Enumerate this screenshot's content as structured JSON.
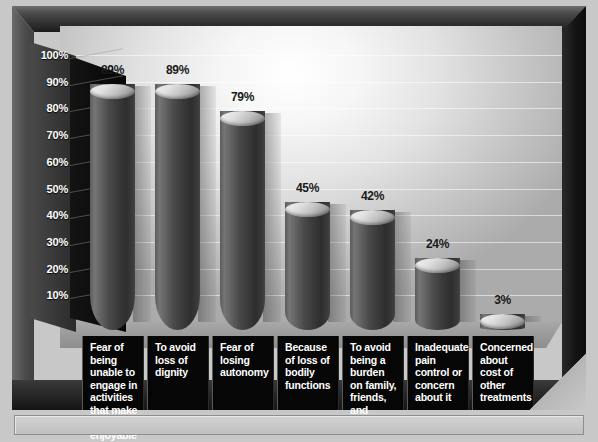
{
  "chart_data": {
    "type": "bar",
    "title": "",
    "subtitle": "",
    "xlabel": "",
    "ylabel": "",
    "ylim": [
      0,
      100
    ],
    "grid": true,
    "legend": "none",
    "categories": [
      "Fear of being unable to engage in activities that make life enjoyable",
      "To avoid loss of dignity",
      "Fear of losing autonomy",
      "Because of loss of bodily functions",
      "To avoid being a burden on family, friends, and caregivers",
      "Inadequate pain control or concern about it",
      "Concerned about cost of other treatments"
    ],
    "values": [
      89,
      89,
      79,
      45,
      42,
      24,
      3
    ],
    "value_labels": [
      "89%",
      "89%",
      "79%",
      "45%",
      "42%",
      "24%",
      "3%"
    ],
    "ytick_labels": [
      "100%",
      "90%",
      "80%",
      "70%",
      "60%",
      "50%",
      "40%",
      "30%",
      "20%",
      "10%"
    ],
    "ytick_values": [
      100,
      90,
      80,
      70,
      60,
      50,
      40,
      30,
      20,
      10
    ]
  },
  "chart": {
    "bar_color": "#3a3a3a",
    "bar_highlight_color": "#757575",
    "bar_top_color": "#e2e2e2",
    "background_color": "#ffffff",
    "frame_color": "#1c1c1c",
    "label_box_color": "#060606",
    "label_text_color": "#ffffff",
    "value_text_color": "#1a1a1a",
    "axis_text_color": "#ffffff"
  },
  "caption": {
    "text": ""
  }
}
